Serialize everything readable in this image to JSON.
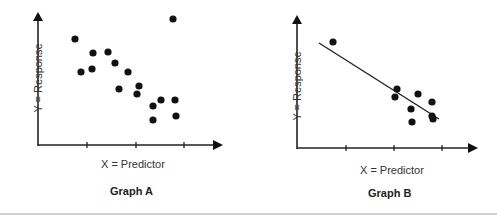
{
  "chart_data": [
    {
      "type": "scatter",
      "title": "Graph A",
      "xlabel": "X = Predictor",
      "ylabel": "Y = Response",
      "xticks": 3,
      "grid": false,
      "x": [
        0.76,
        0.88,
        1.12,
        1.1,
        1.43,
        1.57,
        1.84,
        1.65,
        2.06,
        2.02,
        2.51,
        2.35,
        2.8,
        2.35,
        2.82,
        2.76
      ],
      "y": [
        2.16,
        1.49,
        1.88,
        1.55,
        1.9,
        1.67,
        1.49,
        1.14,
        1.2,
        1.04,
        0.92,
        0.8,
        0.92,
        0.51,
        0.59,
        2.57
      ],
      "points_px": [
        [
          75,
          39
        ],
        [
          81,
          72
        ],
        [
          93,
          53
        ],
        [
          92,
          69
        ],
        [
          108,
          52
        ],
        [
          115,
          63
        ],
        [
          128,
          72
        ],
        [
          119,
          89
        ],
        [
          139,
          86
        ],
        [
          137,
          94
        ],
        [
          161,
          100
        ],
        [
          153,
          106
        ],
        [
          175,
          100
        ],
        [
          153,
          120
        ],
        [
          176,
          116
        ],
        [
          173,
          19
        ]
      ]
    },
    {
      "type": "scatter",
      "title": "Graph B",
      "xlabel": "X = Predictor",
      "ylabel": "Y = Response",
      "xticks": 3,
      "grid": false,
      "regression_line": true,
      "x": [
        0.73,
        2.04,
        2.0,
        2.47,
        2.33,
        2.76,
        2.35,
        2.78,
        2.76
      ],
      "y": [
        2.16,
        1.2,
        1.04,
        1.1,
        0.8,
        0.94,
        0.53,
        0.59,
        0.65
      ],
      "points_px": [
        [
          333,
          42
        ],
        [
          397,
          89
        ],
        [
          395,
          97
        ],
        [
          418,
          94
        ],
        [
          411,
          109
        ],
        [
          432,
          102
        ],
        [
          412,
          122
        ],
        [
          433,
          119
        ],
        [
          432,
          116
        ]
      ],
      "line_px": [
        [
          319,
          43
        ],
        [
          439,
          119
        ]
      ]
    }
  ],
  "graphs": {
    "a": {
      "title": "Graph A",
      "xlabel": "X = Predictor",
      "ylabel": "Y = Response"
    },
    "b": {
      "title": "Graph B",
      "xlabel": "X = Predictor",
      "ylabel": "Y = Response"
    }
  }
}
